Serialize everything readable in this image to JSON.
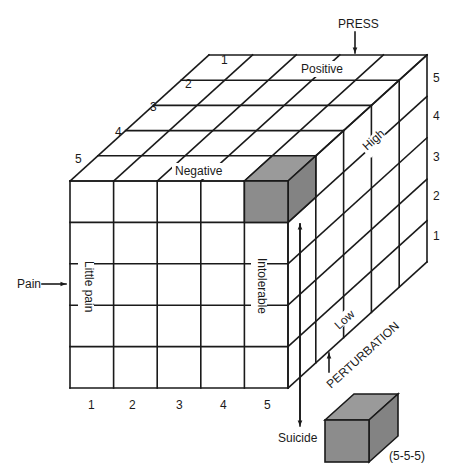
{
  "diagram": {
    "axes": {
      "pain": {
        "label": "Pain",
        "ticks": [
          "1",
          "2",
          "3",
          "4",
          "5"
        ],
        "low_label": "Little pain",
        "high_label": "Intolerable"
      },
      "press": {
        "label": "PRESS",
        "ticks": [
          "1",
          "2",
          "3",
          "4",
          "5"
        ],
        "low_label": "Positive",
        "high_label": "Negative"
      },
      "perturbation": {
        "label": "PERTURBATION",
        "ticks": [
          "1",
          "2",
          "3",
          "4",
          "5"
        ],
        "low_label": "Low",
        "high_label": "High"
      }
    },
    "suicide_label": "Suicide",
    "suicide_cell_label": "(5-5-5)",
    "colors": {
      "line": "#1a1a1a",
      "highlight": "#8c8c8c",
      "background": "#ffffff"
    }
  }
}
